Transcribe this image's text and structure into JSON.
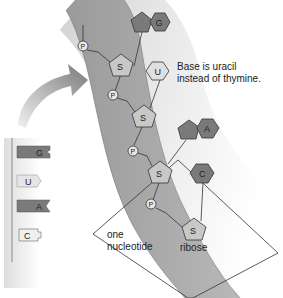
{
  "diagram": {
    "type": "rna-structure",
    "annotation": {
      "line1": "Base is uracil",
      "line2": "instead of thymine."
    },
    "nucleotide_box": {
      "line1": "one",
      "line2": "nucleotide",
      "sugar_label": "ribose"
    },
    "phosphate_label": "P",
    "sugar_label": "S",
    "strand_bases": [
      {
        "label": "G",
        "shape": "purine"
      },
      {
        "label": "U",
        "shape": "pyrimidine"
      },
      {
        "label": "A",
        "shape": "purine"
      },
      {
        "label": "C",
        "shape": "pyrimidine"
      }
    ],
    "side_strand": [
      {
        "label": "G"
      },
      {
        "label": "U"
      },
      {
        "label": "A"
      },
      {
        "label": "C"
      }
    ],
    "colors": {
      "dark_base": "#7a7a7a",
      "light_base": "#dcdcdc",
      "sugar": "#c8c8c8",
      "backbone": "#a8a8a8",
      "arrow": "#8c8c8c"
    }
  }
}
